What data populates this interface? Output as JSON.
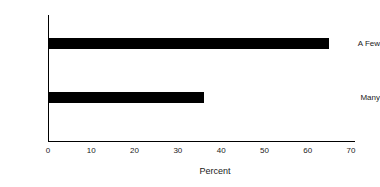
{
  "chart_data": {
    "type": "bar",
    "orientation": "horizontal",
    "title": "",
    "subtitle": "",
    "categories": [
      "A Few",
      "Many"
    ],
    "values": [
      65,
      36
    ],
    "series": [
      {
        "name": "Percent",
        "values": [
          65,
          36
        ]
      }
    ],
    "xlabel": "Percent",
    "ylabel": "",
    "xlim": [
      0,
      70
    ],
    "xticks": [
      0,
      10,
      20,
      30,
      40,
      50,
      60,
      70
    ],
    "xtick_labels": [
      "0",
      "10",
      "20",
      "30",
      "40",
      "50",
      "60",
      "70"
    ],
    "grid": false,
    "legend": false,
    "legend_position": "none",
    "bar_color": "#000000",
    "background_color": "#ffffff",
    "axis_color": "#000000"
  }
}
